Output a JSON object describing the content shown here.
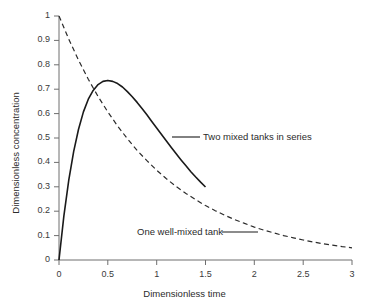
{
  "chart_data": {
    "type": "line",
    "title": "",
    "xlabel": "Dimensionless time",
    "ylabel": "Dimensionless concentration",
    "xlim": [
      0,
      3
    ],
    "ylim": [
      0,
      1
    ],
    "xticks": [
      "0",
      "0.5",
      "1",
      "1.5",
      "2",
      "2.5",
      "3"
    ],
    "xtick_values": [
      0,
      0.5,
      1,
      1.5,
      2,
      2.5,
      3
    ],
    "yticks": [
      "0",
      "0.1",
      "0.2",
      "0.3",
      "0.4",
      "0.5",
      "0.6",
      "0.7",
      "0.8",
      "0.9",
      "1"
    ],
    "ytick_values": [
      0,
      0.1,
      0.2,
      0.3,
      0.4,
      0.5,
      0.6,
      0.7,
      0.8,
      0.9,
      1
    ],
    "grid": false,
    "legend_position": "inline-annotations",
    "series": [
      {
        "name": "Two mixed tanks in series",
        "style": "solid",
        "color": "#1a1a1a",
        "x": [
          0.0,
          0.05,
          0.1,
          0.15,
          0.2,
          0.25,
          0.3,
          0.35,
          0.4,
          0.45,
          0.5,
          0.55,
          0.6,
          0.65,
          0.7,
          0.75,
          0.8,
          0.85,
          0.9,
          0.95,
          1.0,
          1.05,
          1.1,
          1.15,
          1.2,
          1.25,
          1.3,
          1.35,
          1.4,
          1.45,
          1.5
        ],
        "values": [
          0.0,
          0.181,
          0.327,
          0.444,
          0.536,
          0.607,
          0.659,
          0.695,
          0.719,
          0.732,
          0.736,
          0.732,
          0.723,
          0.709,
          0.69,
          0.669,
          0.646,
          0.621,
          0.595,
          0.568,
          0.541,
          0.514,
          0.488,
          0.461,
          0.435,
          0.41,
          0.386,
          0.362,
          0.34,
          0.319,
          0.299
        ]
      },
      {
        "name": "One well-mixed tank",
        "style": "dashed",
        "color": "#2b2b2b",
        "x": [
          0.0,
          0.1,
          0.2,
          0.3,
          0.4,
          0.5,
          0.6,
          0.7,
          0.8,
          0.9,
          1.0,
          1.1,
          1.2,
          1.3,
          1.4,
          1.5,
          1.6,
          1.7,
          1.8,
          1.9,
          2.0,
          2.1,
          2.2,
          2.3,
          2.4,
          2.5,
          2.6,
          2.7,
          2.8,
          2.9,
          3.0
        ],
        "values": [
          1.0,
          0.905,
          0.819,
          0.741,
          0.67,
          0.607,
          0.549,
          0.497,
          0.449,
          0.407,
          0.368,
          0.333,
          0.301,
          0.273,
          0.247,
          0.223,
          0.202,
          0.183,
          0.165,
          0.15,
          0.135,
          0.122,
          0.111,
          0.1,
          0.091,
          0.082,
          0.074,
          0.067,
          0.061,
          0.055,
          0.05
        ]
      }
    ],
    "annotations": [
      {
        "label": "Two mixed tanks in series",
        "text_x": 203,
        "text_y": 131,
        "leader_x1": 172,
        "leader_x2": 200,
        "leader_y": 137
      },
      {
        "label": "One well-mixed tank",
        "text_x": 137,
        "text_y": 226,
        "leader_x1": 222,
        "leader_x2": 258,
        "leader_y": 232
      }
    ],
    "axis_color": "#6e6e6e",
    "text_color": "#2b2b2b"
  }
}
